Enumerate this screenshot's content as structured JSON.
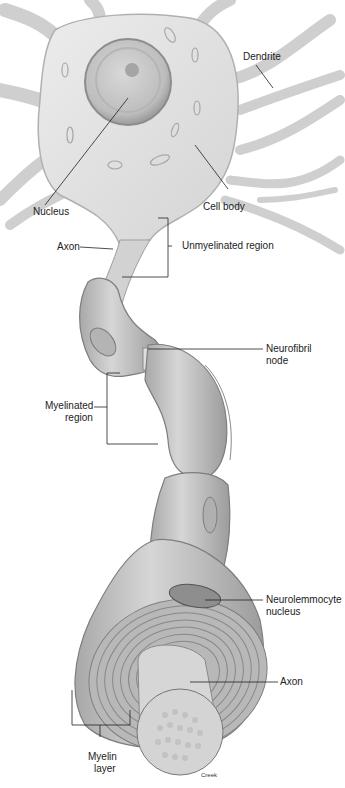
{
  "diagram": {
    "labels": {
      "dendrite": "Dendrite",
      "nucleus": "Nucleus",
      "cell_body": "Cell body",
      "axon_top": "Axon",
      "unmyelinated_region": "Unmyelinated region",
      "neurofibril_node_1": "Neurofibril",
      "neurofibril_node_2": "node",
      "myelinated_region_1": "Myelinated",
      "myelinated_region_2": "region",
      "neurolemmocyte_nucleus_1": "Neurolemmocyte",
      "neurolemmocyte_nucleus_2": "nucleus",
      "axon_bottom": "Axon",
      "myelin_layer_1": "Myelin",
      "myelin_layer_2": "layer"
    },
    "signature": "Creek",
    "colors": {
      "tissue_light": "#e4e4e4",
      "tissue_mid": "#c8c8c8",
      "tissue_dark": "#9a9a9a",
      "leader_line": "#222222"
    }
  }
}
